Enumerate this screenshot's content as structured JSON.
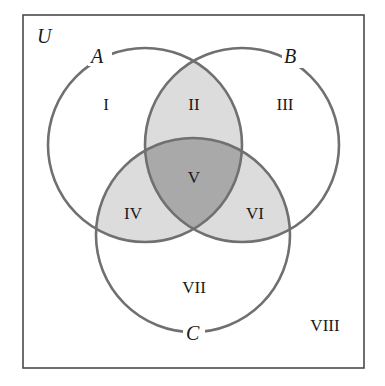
{
  "diagram": {
    "type": "venn-3-set",
    "universe_label": "U",
    "sets": [
      {
        "id": "A",
        "label": "A",
        "cx": 145,
        "cy": 145,
        "r": 97
      },
      {
        "id": "B",
        "label": "B",
        "cx": 242,
        "cy": 145,
        "r": 97
      },
      {
        "id": "C",
        "label": "C",
        "cx": 193,
        "cy": 235,
        "r": 97
      }
    ],
    "regions": [
      {
        "label": "I",
        "description": "A only",
        "x": 106,
        "y": 108
      },
      {
        "label": "II",
        "description": "A and B only",
        "x": 194,
        "y": 108
      },
      {
        "label": "III",
        "description": "B only",
        "x": 285,
        "y": 108
      },
      {
        "label": "IV",
        "description": "A and C only",
        "x": 133,
        "y": 218
      },
      {
        "label": "V",
        "description": "A, B and C",
        "x": 194,
        "y": 182
      },
      {
        "label": "VI",
        "description": "B and C only",
        "x": 255,
        "y": 218
      },
      {
        "label": "VII",
        "description": "C only",
        "x": 194,
        "y": 292
      },
      {
        "label": "VIII",
        "description": "outside A, B, C",
        "x": 324,
        "y": 330
      }
    ],
    "colors": {
      "background": "#ffffff",
      "frame": "#4a4a4a",
      "circle_stroke": "#707070",
      "pairwise_fill": "#dcdcdc",
      "triple_fill": "#a9a9a9"
    }
  }
}
